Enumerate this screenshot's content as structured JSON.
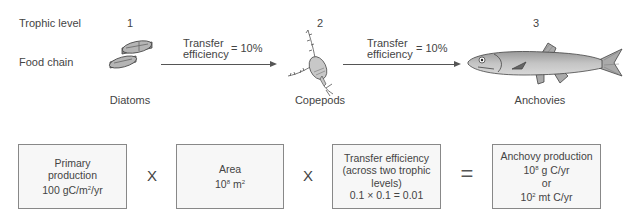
{
  "row_labels": {
    "trophic_level": "Trophic level",
    "food_chain": "Food chain"
  },
  "levels": [
    {
      "number": "1",
      "organism": "Diatoms",
      "icon": "diatoms-icon"
    },
    {
      "number": "2",
      "organism": "Copepods",
      "icon": "copepod-icon"
    },
    {
      "number": "3",
      "organism": "Anchovies",
      "icon": "anchovy-icon"
    }
  ],
  "transfers": [
    {
      "line1": "Transfer",
      "line2": "efficiency",
      "value": "= 10%"
    },
    {
      "line1": "Transfer",
      "line2": "efficiency",
      "value": "= 10%"
    }
  ],
  "equation": {
    "boxes": [
      {
        "lines": [
          "Primary",
          "production"
        ],
        "value_main": "100 gC/m",
        "value_sup": "2",
        "value_tail": "/yr"
      },
      {
        "lines": [
          "Area"
        ],
        "value_main": "10",
        "value_sup": "8",
        "value_tail": " m",
        "value_sup2": "2"
      },
      {
        "lines": [
          "Transfer efficiency",
          "(across two trophic",
          "levels)",
          "0.1 × 0.1 = 0.01"
        ]
      },
      {
        "title": "Anchovy production",
        "l2_main": "10",
        "l2_sup": "8",
        "l2_tail": " g C/yr",
        "l3": "or",
        "l4_main": "10",
        "l4_sup": "2",
        "l4_tail": " mt C/yr"
      }
    ],
    "operators": [
      "X",
      "X",
      "="
    ]
  },
  "colors": {
    "stroke": "#555555",
    "box_fill": "#f7f7f7",
    "box_border": "#888888",
    "organism_fill": "#a8a8a8"
  }
}
